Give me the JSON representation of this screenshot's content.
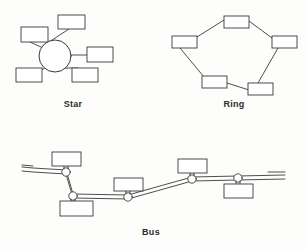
{
  "figure": {
    "background_color": "#fdfdfb",
    "stroke_color": "#3a3a3a",
    "label_color": "#2b2b2b",
    "node_fill": "#ffffff",
    "width": 306,
    "height": 250
  },
  "diagrams": [
    {
      "id": "star",
      "label": "Star",
      "label_x": 73,
      "label_y": 99,
      "hub": {
        "cx": 55,
        "cy": 56,
        "r": 16
      },
      "nodes": [
        {
          "name": "star-node-top-left",
          "x": 21,
          "y": 27,
          "w": 27,
          "h": 15
        },
        {
          "name": "star-node-top",
          "x": 58,
          "y": 15,
          "w": 27,
          "h": 14
        },
        {
          "name": "star-node-right",
          "x": 87,
          "y": 47,
          "w": 26,
          "h": 15
        },
        {
          "name": "star-node-bottom-right",
          "x": 72,
          "y": 68,
          "w": 26,
          "h": 14
        },
        {
          "name": "star-node-bottom-left",
          "x": 16,
          "y": 68,
          "w": 26,
          "h": 14
        }
      ],
      "links": [
        {
          "x1": 43,
          "y1": 48,
          "x2": 30,
          "y2": 42
        },
        {
          "x1": 49,
          "y1": 42,
          "x2": 69,
          "y2": 29
        },
        {
          "x1": 71,
          "y1": 55,
          "x2": 87,
          "y2": 55
        },
        {
          "x1": 65,
          "y1": 68,
          "x2": 78,
          "y2": 68
        },
        {
          "x1": 45,
          "y1": 68,
          "x2": 34,
          "y2": 74
        }
      ]
    },
    {
      "id": "ring",
      "label": "Ring",
      "label_x": 234,
      "label_y": 99,
      "nodes": [
        {
          "name": "ring-node-top",
          "x": 224,
          "y": 16,
          "w": 25,
          "h": 12
        },
        {
          "name": "ring-node-left",
          "x": 172,
          "y": 36,
          "w": 25,
          "h": 12
        },
        {
          "name": "ring-node-right",
          "x": 272,
          "y": 36,
          "w": 25,
          "h": 12
        },
        {
          "name": "ring-node-bottom-left",
          "x": 202,
          "y": 76,
          "w": 25,
          "h": 12
        },
        {
          "name": "ring-node-bottom-right",
          "x": 248,
          "y": 83,
          "w": 25,
          "h": 12
        }
      ],
      "links": [
        {
          "x1": 224,
          "y1": 20,
          "x2": 197,
          "y2": 37
        },
        {
          "x1": 249,
          "y1": 21,
          "x2": 272,
          "y2": 38
        },
        {
          "x1": 180,
          "y1": 48,
          "x2": 204,
          "y2": 77
        },
        {
          "x1": 278,
          "y1": 48,
          "x2": 258,
          "y2": 83
        },
        {
          "x1": 227,
          "y1": 83,
          "x2": 249,
          "y2": 90
        }
      ]
    },
    {
      "id": "bus",
      "label": "Bus",
      "label_x": 151,
      "label_y": 227,
      "cable": [
        {
          "x": 33,
          "y": 170
        },
        {
          "x": 66,
          "y": 172
        },
        {
          "x": 73,
          "y": 196
        },
        {
          "x": 128,
          "y": 197
        },
        {
          "x": 192,
          "y": 179
        },
        {
          "x": 238,
          "y": 178
        },
        {
          "x": 278,
          "y": 177
        }
      ],
      "taps": [
        {
          "name": "bus-tap-1",
          "cx": 66,
          "cy": 172,
          "r": 4
        },
        {
          "name": "bus-tap-2",
          "cx": 73,
          "cy": 196,
          "r": 4
        },
        {
          "name": "bus-tap-3",
          "cx": 128,
          "cy": 197,
          "r": 4
        },
        {
          "name": "bus-tap-4",
          "cx": 192,
          "cy": 179,
          "r": 4
        },
        {
          "name": "bus-tap-5",
          "cx": 238,
          "cy": 178,
          "r": 4
        }
      ],
      "nodes": [
        {
          "name": "bus-node-1",
          "x": 52,
          "y": 152,
          "w": 29,
          "h": 14,
          "stem_x": 66,
          "stem_y1": 166,
          "stem_y2": 169
        },
        {
          "name": "bus-node-2",
          "x": 60,
          "y": 200,
          "w": 33,
          "h": 15,
          "stem_x": 73,
          "stem_y1": 199,
          "stem_y2": 200
        },
        {
          "name": "bus-node-3",
          "x": 114,
          "y": 178,
          "w": 29,
          "h": 13,
          "stem_x": 128,
          "stem_y1": 191,
          "stem_y2": 194
        },
        {
          "name": "bus-node-4",
          "x": 178,
          "y": 159,
          "w": 29,
          "h": 14,
          "stem_x": 192,
          "stem_y1": 173,
          "stem_y2": 176
        },
        {
          "name": "bus-node-5",
          "x": 224,
          "y": 184,
          "w": 29,
          "h": 14,
          "stem_x": 238,
          "stem_y1": 181,
          "stem_y2": 184
        }
      ],
      "terminators": [
        {
          "name": "bus-terminator-left",
          "x1": 22,
          "y1": 169,
          "x2": 33,
          "y2": 170
        },
        {
          "name": "bus-terminator-right",
          "x1": 266,
          "y1": 177,
          "x2": 285,
          "y2": 177
        }
      ]
    }
  ]
}
